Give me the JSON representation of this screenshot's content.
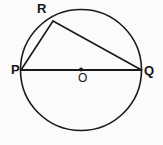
{
  "figure": {
    "background_color": "#fbfbfb",
    "stroke_color": "#1a1a1a",
    "labels": {
      "R": "R",
      "P": "P",
      "Q": "Q",
      "O": "O"
    },
    "geometry": {
      "circle": {
        "cx": 81,
        "cy": 70,
        "r": 60.5
      },
      "center_dot": {
        "cx": 81,
        "cy": 69.5,
        "r": 2
      },
      "points": {
        "P": {
          "x": 21,
          "y": 70
        },
        "Q": {
          "x": 141.5,
          "y": 70
        },
        "R": {
          "x": 53,
          "y": 21
        },
        "O": {
          "x": 81,
          "y": 70
        }
      },
      "segments": [
        {
          "name": "PQ",
          "from": "P",
          "to": "Q"
        },
        {
          "name": "PR",
          "from": "P",
          "to": "R"
        },
        {
          "name": "RQ",
          "from": "R",
          "to": "Q"
        }
      ]
    }
  }
}
